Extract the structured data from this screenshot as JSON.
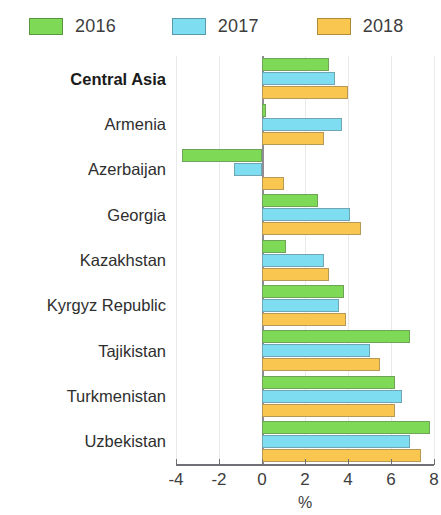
{
  "legend": {
    "items": [
      {
        "label": "2016",
        "color": "#7ED957"
      },
      {
        "label": "2017",
        "color": "#7FDDF2"
      },
      {
        "label": "2018",
        "color": "#F9C74F"
      }
    ]
  },
  "axis": {
    "title": "%",
    "ticks": [
      "-4",
      "-2",
      "0",
      "2",
      "4",
      "6",
      "8"
    ]
  },
  "chart_data": {
    "type": "bar",
    "orientation": "horizontal",
    "title": "",
    "xlabel": "%",
    "ylabel": "",
    "xlim": [
      -4,
      8
    ],
    "xticks": [
      -4,
      -2,
      0,
      2,
      4,
      6,
      8
    ],
    "grid": true,
    "legend_position": "top",
    "categories": [
      "Central Asia",
      "Armenia",
      "Azerbaijan",
      "Georgia",
      "Kazakhstan",
      "Kyrgyz Republic",
      "Tajikistan",
      "Turkmenistan",
      "Uzbekistan"
    ],
    "bold_categories": [
      "Central Asia"
    ],
    "series": [
      {
        "name": "2016",
        "color": "#7ED957",
        "values": [
          3.1,
          0.2,
          -3.7,
          2.6,
          1.1,
          3.8,
          6.9,
          6.2,
          7.8
        ]
      },
      {
        "name": "2017",
        "color": "#7FDDF2",
        "values": [
          3.4,
          3.7,
          -1.3,
          4.1,
          2.9,
          3.6,
          5.0,
          6.5,
          6.9
        ]
      },
      {
        "name": "2018",
        "color": "#F9C74F",
        "values": [
          4.0,
          2.9,
          1.0,
          4.6,
          3.1,
          3.9,
          5.5,
          6.2,
          7.4
        ]
      }
    ]
  }
}
